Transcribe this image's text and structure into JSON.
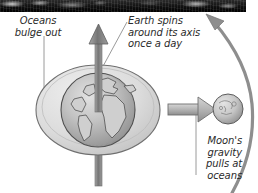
{
  "figure": {
    "title_band": "lunar-surface-photo-strip",
    "background_color": "#ffffff",
    "ink_color": "#2b2b2b"
  },
  "labels": {
    "oceans_bulge": "Oceans\nbulge out",
    "earth_spins": "Earth spins\naround its axis\nonce a day",
    "moon_gravity": "Moon's\ngravity\npulls at\noceans"
  },
  "objects": {
    "earth": {
      "name": "Earth",
      "fill": "#b9b9b9",
      "outline": "#4a4a4a"
    },
    "ocean_bulge": {
      "name": "Ocean bulge ellipse",
      "fill": "#d8d8d8",
      "outline": "#6a6a6a"
    },
    "moon": {
      "name": "Moon",
      "fill": "#bdbdbd",
      "outline": "#5a5a5a"
    },
    "spin_axis_arrow": {
      "name": "Earth rotation axis arrow",
      "direction": "up",
      "fill": "#8c8c8c"
    },
    "gravity_arrow": {
      "name": "Moon gravity arrow",
      "direction": "right",
      "fill": "#b5b5b5"
    },
    "orbit_arrow": {
      "name": "Moon orbit curved arrow",
      "direction": "counter-clockwise-up",
      "stroke": "#8e8e8e"
    }
  }
}
